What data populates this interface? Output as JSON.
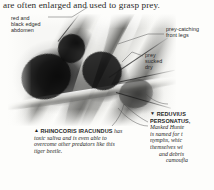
{
  "page": {
    "body_text": "are often enlarged and used to grasp prey."
  },
  "photo": {
    "alt_description": "Black and white photograph of an assassin bug grasping a tiger beetle on plant stems"
  },
  "annotations": [
    {
      "name": "abdomen",
      "lines": [
        "red and",
        "black edged",
        "abdomen"
      ]
    },
    {
      "name": "front-legs",
      "lines": [
        "prey-catching",
        "front legs"
      ]
    },
    {
      "name": "prey-sucked-dry",
      "lines": [
        "prey",
        "sucked",
        "dry"
      ]
    }
  ],
  "caption_left": {
    "marker": "▲",
    "species": "RHINOCORIS IRACUNDUS",
    "lines": [
      "has",
      "toxic saliva and is even able to",
      "overcome other predators like this",
      "tiger beetle."
    ]
  },
  "caption_right": {
    "marker": "▼",
    "lines": [
      "REDUVIUS",
      "PERSONATUS,",
      "Masked Hunte",
      "is named for t",
      "nymphs, whic",
      "themselves wi",
      "and debris",
      "camoufla"
    ]
  }
}
